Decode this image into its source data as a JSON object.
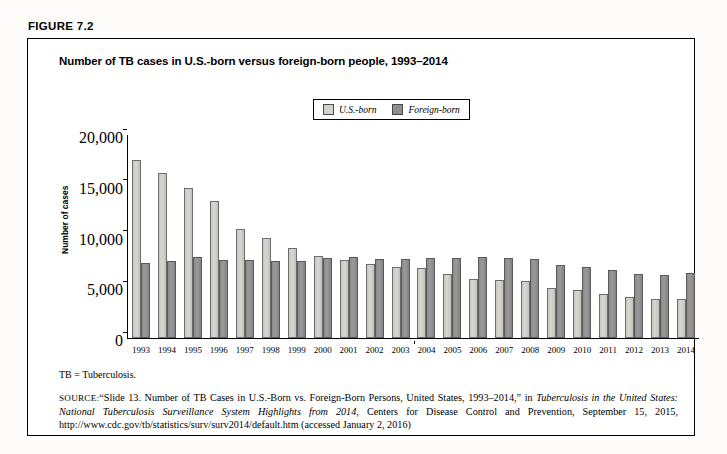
{
  "figure": {
    "label": "FIGURE 7.2",
    "title": "Number of TB cases in U.S.-born versus foreign-born people, 1993–2014"
  },
  "legend": {
    "position": "top-center",
    "items": [
      {
        "label": "U.S.-born",
        "color": "#d4d2cd",
        "swatch": "us-born-swatch"
      },
      {
        "label": "Foreign-born",
        "color": "#8e8e8e",
        "swatch": "foreign-born-swatch"
      }
    ]
  },
  "footnote": "TB = Tuberculosis.",
  "source": {
    "tag": "SOURCE:",
    "part1": "“Slide 13. Number of TB Cases in U.S.-Born vs. Foreign-Born Persons, United States, 1993–2014,” in ",
    "italic1": "Tuberculosis in the United States: National Tuberculosis Surveillance System Highlights from 2014",
    "part2": ", Centers for Disease Control and Prevention, September 15, 2015, http://www.cdc.gov/tb/statistics/surv/surv2014/default.htm (accessed January 2, 2016)"
  },
  "chart_data": {
    "type": "bar",
    "title": "Number of TB cases in U.S.-born versus foreign-born people, 1993–2014",
    "xlabel": "",
    "ylabel": "Number of cases",
    "ylim": [
      0,
      20000
    ],
    "yticks": [
      0,
      5000,
      10000,
      15000,
      20000
    ],
    "ytick_labels": [
      "0",
      "5,000",
      "10,000",
      "15,000",
      "20,000"
    ],
    "grid": false,
    "categories": [
      "1993",
      "1994",
      "1995",
      "1996",
      "1997",
      "1998",
      "1999",
      "2000",
      "2001",
      "2002",
      "2003",
      "2004",
      "2005",
      "2006",
      "2007",
      "2008",
      "2009",
      "2010",
      "2011",
      "2012",
      "2013",
      "2014"
    ],
    "series": [
      {
        "name": "U.S.-born",
        "color": "#d4d2cd",
        "values": [
          17500,
          16300,
          14800,
          13500,
          10700,
          9900,
          8900,
          8100,
          7700,
          7300,
          7000,
          6900,
          6300,
          5800,
          5700,
          5600,
          4900,
          4700,
          4300,
          4000,
          3800,
          3800
        ]
      },
      {
        "name": "Foreign-born",
        "color": "#8e8e8e",
        "values": [
          7400,
          7600,
          8000,
          7700,
          7700,
          7600,
          7600,
          7900,
          8000,
          7800,
          7800,
          7900,
          7900,
          8000,
          7900,
          7800,
          7200,
          7000,
          6700,
          6300,
          6200,
          6400
        ]
      }
    ]
  }
}
